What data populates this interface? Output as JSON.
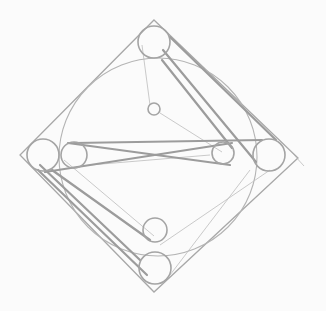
{
  "diagram": {
    "title": "",
    "colors": {
      "background": "#fbfbfb",
      "line_light": "#bcbcbc",
      "line_mid": "#a8a8a8",
      "line_dark": "#9c9c9c"
    },
    "elements": [
      {
        "kind": "square-rotated",
        "label": "outer-diamond"
      },
      {
        "kind": "circle",
        "label": "inscribed-circle"
      },
      {
        "kind": "circle",
        "label": "top-pulley"
      },
      {
        "kind": "circle",
        "label": "left-pulley"
      },
      {
        "kind": "circle",
        "label": "left-inner-pulley"
      },
      {
        "kind": "circle",
        "label": "right-pulley"
      },
      {
        "kind": "circle",
        "label": "right-inner-pulley"
      },
      {
        "kind": "circle",
        "label": "bottom-pulley"
      },
      {
        "kind": "circle",
        "label": "bottom-inner-pulley"
      },
      {
        "kind": "circle",
        "label": "center-small-circle"
      }
    ]
  }
}
